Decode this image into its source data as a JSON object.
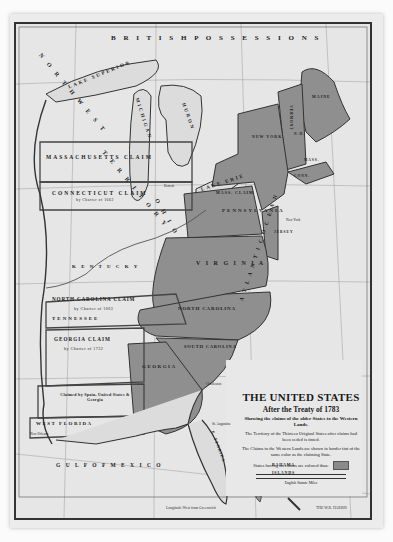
{
  "map": {
    "title": "THE UNITED STATES",
    "subtitle": "After the Treaty of 1783",
    "description": "Showing the claims of the older States to the Western Lands.",
    "note_1": "The Territory of the Thirteen Original States after claims had been ceded is tinted.",
    "note_2": "The Claims to the Western Lands are shown in border tint of the same color as the claiming State.",
    "legend_swatch_label": "States having no claims are colored thus:",
    "scale_label": "English Statute Miles",
    "scale_ticks": [
      "0",
      "50",
      "100",
      "150",
      "200"
    ],
    "bottom_longitude_label": "Longitude West from Greenwich",
    "publisher_mark": "THE W.R. HARRIS",
    "colors": {
      "paper": "#e6e6e6",
      "tinted_states": "#8f8f8f",
      "water": "#e9e9e9",
      "border": "#333333",
      "claim_outline": "#444444"
    }
  },
  "labels": {
    "british_possessions": "B R I T I S H   P O S S E S S I O N S",
    "lake_superior": "LAKE SUPERIOR",
    "lake_michigan": "MICHIGAN",
    "lake_huron": "HURON",
    "lake_erie": "LAKE ERIE",
    "northwest": "N O R T H W E S T",
    "territory": "T E R R I T O R Y",
    "massachusetts_claim": "MASSACHUSETTS   CLAIM",
    "connecticut_claim": "CONNECTICUT  CLAIM",
    "connecticut_charter": "by Charter of 1662",
    "mass_claim_ny": "MASS. CLAIM",
    "ohio": "O H I O",
    "kentucky": "K E N T U C K Y",
    "virginia": "V I R G I N I A",
    "pennsylvania": "PENNSYLVANIA",
    "new_york": "NEW YORK",
    "vermont": "VERMONT",
    "new_hampshire": "N.H.",
    "maine": "MAINE",
    "massachusetts": "MASS.",
    "connecticut": "CONN.",
    "new_jersey": "JERSEY",
    "north_carolina_claim": "NORTH CAROLINA CLAIM",
    "nc_charter": "by Charter of 1663",
    "tennessee": "TENNESSEE",
    "north_carolina": "NORTH CAROLINA",
    "south_carolina": "SOUTH CAROLINA",
    "georgia_claim": "GEORGIA CLAIM",
    "georgia_charter": "by Charter of 1732",
    "georgia": "GEORGIA",
    "claimed_by_spain": "Claimed by Spain, United States & Georgia",
    "west_florida": "WEST FLORIDA",
    "east_florida": "E. FLORIDA",
    "gulf_of_mexico": "G U L F   O F   M E X I C O",
    "atlantic_ocean": "A T L A N T I C   O C E A N",
    "bahama_islands_1": "BAHAMA",
    "bahama_islands_2": "ISLANDS",
    "charleston": "Charleston",
    "st_augustine": "St. Augustine",
    "new_york_city": "New York",
    "detroit": "Detroit",
    "new_orleans": "New Orleans"
  }
}
